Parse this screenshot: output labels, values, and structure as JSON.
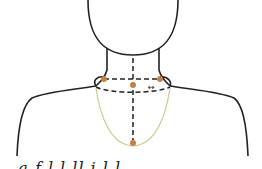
{
  "figure": {
    "colors": {
      "outline": "#222222",
      "landmark": "#c8813e",
      "necklace_curve": "#c9c98a",
      "background": "#ffffff"
    },
    "landmarks": [
      {
        "name": "left-neck-base",
        "x": 104,
        "y": 79
      },
      {
        "name": "center-neck-front",
        "x": 133,
        "y": 85
      },
      {
        "name": "right-neck-base",
        "x": 160,
        "y": 79
      },
      {
        "name": "necklace-lowest-point",
        "x": 133,
        "y": 143
      }
    ],
    "arrow_symbol": "↔",
    "caption_partial": "...a  f      l l       ll   i  l l"
  }
}
